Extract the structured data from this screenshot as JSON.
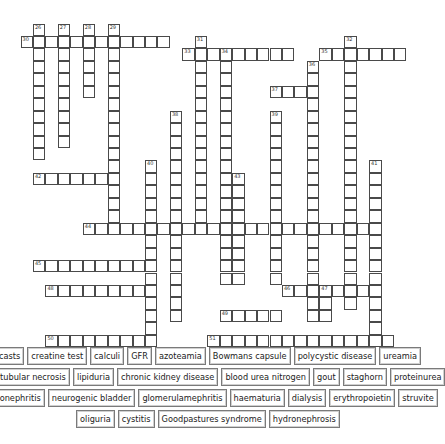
{
  "puzzle": {
    "type": "crossword",
    "grid_origin": {
      "x": 20.5,
      "y": 23.5,
      "cell": 12.45
    },
    "entries": [
      {
        "num": "26",
        "dir": "down",
        "col": 1,
        "row": 0,
        "len": 11
      },
      {
        "num": "27",
        "dir": "down",
        "col": 3,
        "row": 0,
        "len": 10
      },
      {
        "num": "28",
        "dir": "down",
        "col": 5,
        "row": 0,
        "len": 6
      },
      {
        "num": "29",
        "dir": "down",
        "col": 7,
        "row": 0,
        "len": 17
      },
      {
        "num": "30",
        "dir": "across",
        "col": 0,
        "row": 1,
        "len": 12
      },
      {
        "num": "31",
        "dir": "down",
        "col": 14,
        "row": 1,
        "len": 16
      },
      {
        "num": "32",
        "dir": "down",
        "col": 26,
        "row": 1,
        "len": 22
      },
      {
        "num": "33",
        "dir": "across",
        "col": 13,
        "row": 2,
        "len": 9
      },
      {
        "num": "34",
        "dir": "down",
        "col": 16,
        "row": 2,
        "len": 19
      },
      {
        "num": "35",
        "dir": "across",
        "col": 24,
        "row": 2,
        "len": 7
      },
      {
        "num": "36",
        "dir": "down",
        "col": 23,
        "row": 3,
        "len": 21
      },
      {
        "num": "37",
        "dir": "across",
        "col": 20,
        "row": 5,
        "len": 4
      },
      {
        "num": "38",
        "dir": "down",
        "col": 12,
        "row": 7,
        "len": 17
      },
      {
        "num": "39",
        "dir": "down",
        "col": 20,
        "row": 7,
        "len": 14
      },
      {
        "num": "40",
        "dir": "down",
        "col": 10,
        "row": 11,
        "len": 15
      },
      {
        "num": "41",
        "dir": "down",
        "col": 28,
        "row": 11,
        "len": 15
      },
      {
        "num": "42",
        "dir": "across",
        "col": 1,
        "row": 12,
        "len": 7
      },
      {
        "num": "43",
        "dir": "down",
        "col": 17,
        "row": 12,
        "len": 9
      },
      {
        "num": "44",
        "dir": "across",
        "col": 5,
        "row": 16,
        "len": 24
      },
      {
        "num": "45",
        "dir": "across",
        "col": 1,
        "row": 19,
        "len": 9
      },
      {
        "num": "46",
        "dir": "across",
        "col": 21,
        "row": 21,
        "len": 8
      },
      {
        "num": "47",
        "dir": "down",
        "col": 24,
        "row": 21,
        "len": 3
      },
      {
        "num": "48",
        "dir": "across",
        "col": 2,
        "row": 21,
        "len": 8
      },
      {
        "num": "49",
        "dir": "across",
        "col": 16,
        "row": 23,
        "len": 5
      },
      {
        "num": "50",
        "dir": "across",
        "col": 2,
        "row": 25,
        "len": 8
      },
      {
        "num": "51",
        "dir": "across",
        "col": 15,
        "row": 25,
        "len": 15
      }
    ]
  },
  "word_bank": {
    "rows": [
      [
        "casts",
        "creatine test",
        "calculi",
        "GFR",
        "azoteamia",
        "Bowmans capsule",
        "polycystic disease",
        "ureamia"
      ],
      [
        "acute tubular necrosis",
        "lipiduria",
        "chronic kidney disease",
        "blood urea nitrogen",
        "gout",
        "staghorn",
        "proteinurea"
      ],
      [
        "pyelonephritis",
        "neurogenic bladder",
        "glomerulamephritis",
        "haematuria",
        "dialysis",
        "erythropoietin",
        "struvite"
      ],
      [
        "oliguria",
        "cystitis",
        "Goodpastures syndrome",
        "hydronephrosis"
      ]
    ]
  }
}
